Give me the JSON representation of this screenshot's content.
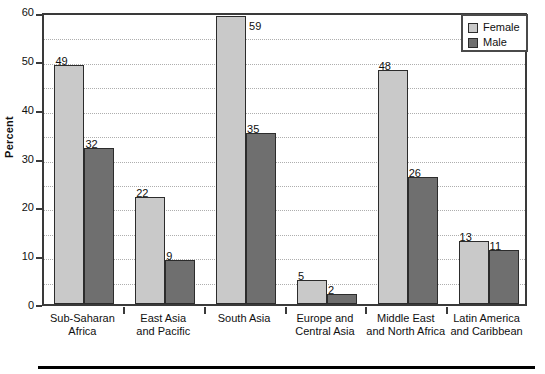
{
  "chart_data": {
    "type": "bar",
    "title": "",
    "xlabel": "",
    "ylabel": "Percent",
    "ylim": [
      0,
      60
    ],
    "ytick_labels": [
      "0",
      "10",
      "20",
      "30",
      "40",
      "50",
      "60"
    ],
    "ytick_values": [
      0,
      10,
      20,
      30,
      40,
      50,
      60
    ],
    "gridlines": [
      5,
      10,
      15,
      20,
      25,
      30,
      35,
      40,
      45,
      50,
      55
    ],
    "grid": true,
    "legend_position": "top-right",
    "categories": [
      "Sub-Saharan Africa",
      "East Asia and Pacific",
      "South Asia",
      "Europe and Central Asia",
      "Middle East and North Africa",
      "Latin America and Caribbean"
    ],
    "category_lines": [
      [
        "Sub-Saharan",
        "Africa"
      ],
      [
        "East Asia",
        "and Pacific"
      ],
      [
        "South Asia",
        ""
      ],
      [
        "Europe and",
        "Central Asia"
      ],
      [
        "Middle East",
        "and North Africa"
      ],
      [
        "Latin America",
        "and Caribbean"
      ]
    ],
    "series": [
      {
        "name": "Female",
        "color": "#c9c9c9",
        "values": [
          49,
          22,
          59,
          5,
          48,
          13
        ]
      },
      {
        "name": "Male",
        "color": "#6f6f6f",
        "values": [
          32,
          9,
          35,
          2,
          26,
          11
        ]
      }
    ]
  },
  "legend": {
    "items": [
      {
        "label": "Female"
      },
      {
        "label": "Male"
      }
    ]
  },
  "colors": {
    "female": "#c9c9c9",
    "male": "#6f6f6f",
    "axis": "#3a3a3a",
    "grid": "#aeaeae",
    "text": "#101010"
  }
}
